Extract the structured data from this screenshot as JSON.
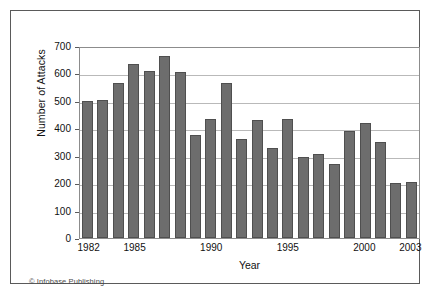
{
  "figure": {
    "credit": "© Infobase Publishing",
    "frame_color": "#5a5a5a",
    "bar_color": "#6d6d6d",
    "bar_edge_color": "#4f4f4f",
    "grid_color": "#b9b9b9",
    "background": "#ffffff"
  },
  "chart_data": {
    "type": "bar",
    "title": "",
    "subtitle": "",
    "xlabel": "Year",
    "ylabel": "Number of Attacks",
    "categories": [
      "1982",
      "1983",
      "1984",
      "1985",
      "1986",
      "1987",
      "1988",
      "1989",
      "1990",
      "1991",
      "1992",
      "1993",
      "1994",
      "1995",
      "1996",
      "1997",
      "1998",
      "1999",
      "2000",
      "2001",
      "2002",
      "2003"
    ],
    "values": [
      500,
      505,
      565,
      635,
      610,
      665,
      605,
      375,
      435,
      565,
      360,
      430,
      330,
      435,
      295,
      305,
      270,
      390,
      420,
      350,
      200,
      205
    ],
    "ylim": [
      0,
      700
    ],
    "ytick_labels": [
      "0",
      "100",
      "200",
      "300",
      "400",
      "500",
      "600",
      "700"
    ],
    "ytick_values": [
      0,
      100,
      200,
      300,
      400,
      500,
      600,
      700
    ],
    "xtick_labels": [
      "1982",
      "1985",
      "1990",
      "1995",
      "2000",
      "2003"
    ],
    "xtick_categories": [
      "1982",
      "1985",
      "1990",
      "1995",
      "2000",
      "2003"
    ],
    "grid": "horizontal",
    "legend": "none",
    "annotations": [
      "© Infobase Publishing"
    ]
  }
}
